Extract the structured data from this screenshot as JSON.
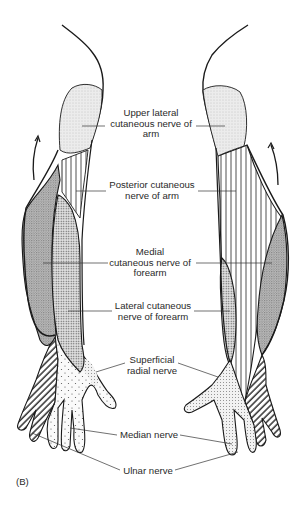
{
  "figure": {
    "panel_label": "(B)"
  },
  "labels": {
    "upper_lateral": [
      "Upper lateral",
      "cutaneous nerve of",
      "arm"
    ],
    "posterior": [
      "Posterior cutaneous",
      "nerve of arm"
    ],
    "medial": [
      "Medial",
      "cutaneous nerve of",
      "forearm"
    ],
    "lateral": [
      "Lateral cutaneous",
      "nerve of forearm"
    ],
    "superficial_radial": [
      "Superficial",
      "radial nerve"
    ],
    "median": [
      "Median nerve"
    ],
    "ulnar": [
      "Ulnar nerve"
    ]
  },
  "colors": {
    "outline": "#1a1a1a",
    "leader": "#333333",
    "light_fill": "#e8e8e8",
    "dark_fill": "#b4b4b4",
    "dot_fill": "#d6d6d6",
    "background": "#ffffff"
  },
  "regions": [
    {
      "name": "upper-lateral-cutaneous-nerve-of-arm",
      "pattern": "fine light stipple"
    },
    {
      "name": "posterior-cutaneous-nerve-of-arm",
      "pattern": "vertical lines"
    },
    {
      "name": "medial-cutaneous-nerve-of-forearm",
      "pattern": "dark crosshatch"
    },
    {
      "name": "lateral-cutaneous-nerve-of-forearm",
      "pattern": "dense dots"
    },
    {
      "name": "superficial-radial-nerve",
      "pattern": "sparse dots"
    },
    {
      "name": "median-nerve",
      "pattern": "sparse dots"
    },
    {
      "name": "ulnar-nerve",
      "pattern": "diagonal stripes"
    }
  ]
}
